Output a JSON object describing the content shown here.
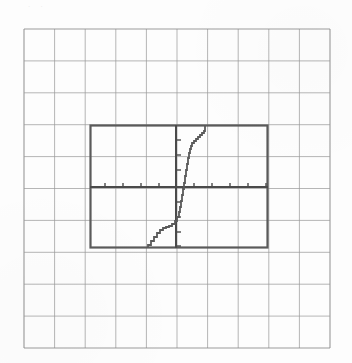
{
  "page": {
    "background_color": "#fdfdfd",
    "width": 352,
    "height": 363,
    "top_artifact_text": ". ."
  },
  "graph_paper": {
    "name": "graph-paper-grid",
    "columns": 10,
    "rows": 10,
    "x_start": 24,
    "y_start": 29,
    "x_end": 330,
    "y_end": 348,
    "cell_width": 30.6,
    "cell_height": 31.9,
    "line_color": "#9a9a9a",
    "line_width": 1.0,
    "border_color": "#8c8c8c"
  },
  "calculator_screen": {
    "name": "calculator-viewport",
    "left": 90,
    "top": 125,
    "right": 268,
    "bottom": 248,
    "width": 178,
    "height": 123,
    "border_color": "#5a5a5a",
    "border_width": 2.2,
    "fill": "none"
  },
  "axes": {
    "color": "#4a4a4a",
    "line_width": 2.0,
    "tick_color": "#4a4a4a",
    "tick_length": 4,
    "x_axis": {
      "name": "x-axis",
      "y_pixel": 187,
      "x_start": 90,
      "x_end": 268,
      "tick_spacing_px": 18,
      "ticks_px": [
        105,
        123,
        141,
        159,
        194,
        212,
        230,
        248,
        266
      ],
      "range": [
        -5,
        5
      ]
    },
    "y_axis": {
      "name": "y-axis",
      "x_pixel": 176,
      "y_start": 125,
      "y_end": 248,
      "tick_spacing_px": 15,
      "ticks_px": [
        140,
        155,
        170,
        202,
        217,
        232,
        246
      ],
      "range": [
        -4,
        4
      ]
    },
    "origin_px": [
      176,
      187
    ]
  },
  "chart_data": {
    "type": "line",
    "title": "",
    "subtitle": "",
    "xlabel": "",
    "ylabel": "",
    "grid": true,
    "legend": null,
    "xlim": [
      -5,
      5
    ],
    "ylim": [
      -4,
      4
    ],
    "xtick_step": 1,
    "ytick_step": 1,
    "series": [
      {
        "name": "plotted-curve",
        "color": "#5a5a5a",
        "line_width": 1.8,
        "points_px": [
          [
            148,
            248
          ],
          [
            151,
            245
          ],
          [
            154,
            241
          ],
          [
            157,
            237
          ],
          [
            160,
            233
          ],
          [
            163,
            230
          ],
          [
            166,
            228
          ],
          [
            169,
            227
          ],
          [
            172,
            226
          ],
          [
            175,
            224
          ],
          [
            177,
            221
          ],
          [
            179,
            217
          ],
          [
            180,
            212
          ],
          [
            181,
            207
          ],
          [
            182,
            201
          ],
          [
            183,
            195
          ],
          [
            184,
            189
          ],
          [
            185,
            183
          ],
          [
            186,
            176
          ],
          [
            187,
            170
          ],
          [
            188,
            164
          ],
          [
            189,
            158
          ],
          [
            190,
            153
          ],
          [
            191,
            149
          ],
          [
            192,
            146
          ],
          [
            194,
            143
          ],
          [
            196,
            141
          ],
          [
            198,
            139
          ],
          [
            200,
            137
          ],
          [
            202,
            135
          ],
          [
            204,
            133
          ],
          [
            205,
            131
          ],
          [
            205,
            128
          ],
          [
            205,
            125
          ]
        ],
        "x_values": [
          -2.0,
          -1.8,
          -1.6,
          -1.4,
          -1.2,
          -1.0,
          -0.8,
          -0.6,
          -0.4,
          -0.2,
          0.0,
          0.2,
          0.4,
          0.6,
          0.8,
          1.0,
          1.2,
          1.4,
          1.6,
          1.8,
          2.0
        ],
        "y_values": [
          -4.0,
          -3.7,
          -3.3,
          -3.0,
          -2.8,
          -2.6,
          -2.4,
          -2.1,
          -1.5,
          -0.8,
          0.0,
          0.8,
          1.5,
          2.1,
          2.4,
          2.6,
          2.8,
          3.0,
          3.3,
          3.7,
          4.0
        ]
      }
    ]
  }
}
